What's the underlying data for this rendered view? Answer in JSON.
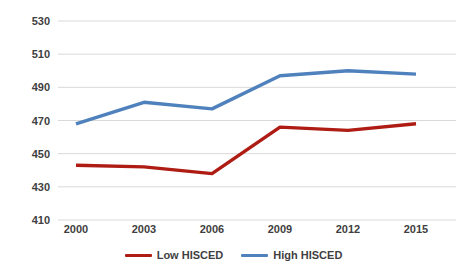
{
  "chart_data": {
    "type": "line",
    "categories": [
      "2000",
      "2003",
      "2006",
      "2009",
      "2012",
      "2015"
    ],
    "series": [
      {
        "name": "Low HISCED",
        "color": "#ae1c14",
        "values": [
          443,
          442,
          438,
          466,
          464,
          468
        ]
      },
      {
        "name": "High HISCED",
        "color": "#4f81bd",
        "values": [
          468,
          481,
          477,
          497,
          500,
          498
        ]
      }
    ],
    "title": "",
    "xlabel": "",
    "ylabel": "",
    "ylim": [
      410,
      530
    ],
    "yticks": [
      530,
      510,
      490,
      470,
      450,
      430,
      410
    ],
    "grid": true,
    "legend_position": "bottom",
    "gridline_color": "#d9d9d9",
    "tick_label_color": "#3f3f3f",
    "background": "#ffffff"
  }
}
